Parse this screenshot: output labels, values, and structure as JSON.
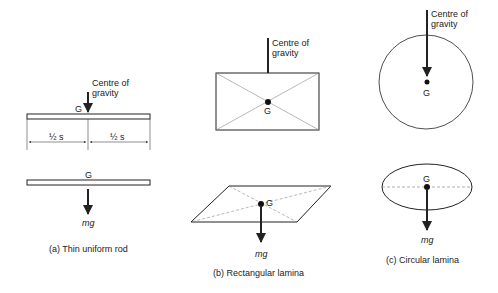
{
  "panels": {
    "a": {
      "caption": "(a) Thin uniform rod",
      "cog_label_line1": "Centre of",
      "cog_label_line2": "gravity",
      "g_label_top": "G",
      "half_left": "½ s",
      "half_right": "½ s",
      "g_label_bottom": "G",
      "weight_label": "mg"
    },
    "b": {
      "caption": "(b) Rectangular lamina",
      "cog_label_line1": "Centre of",
      "cog_label_line2": "gravity",
      "g_label_top": "G",
      "g_label_bottom": "G",
      "weight_label": "mg"
    },
    "c": {
      "caption": "(c) Circular lamina",
      "cog_label_line1": "Centre of",
      "cog_label_line2": "gravity",
      "g_label_top": "G",
      "g_label_bottom": "G",
      "weight_label": "mg"
    }
  },
  "colors": {
    "ink": "#222222",
    "background": "#ffffff"
  }
}
